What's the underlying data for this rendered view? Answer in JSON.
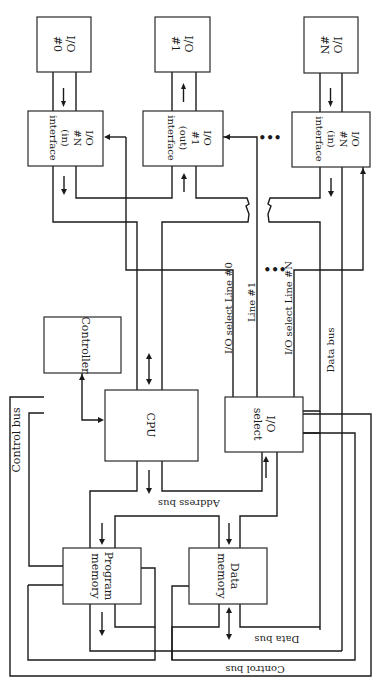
{
  "figure": {
    "orientation": "rotated-90-clockwise",
    "blocks": {
      "io0": {
        "line1": "I/O",
        "line2": "#0"
      },
      "io1": {
        "line1": "I/O",
        "line2": "#1"
      },
      "ioN": {
        "line1": "I/O",
        "line2": "#N"
      },
      "if_left": {
        "line1": "I/O",
        "line2": "#N",
        "line3": "(in)",
        "line4": "interface"
      },
      "if_mid": {
        "line1": "I/O",
        "line2": "#1",
        "line3": "(out)",
        "line4": "interface"
      },
      "if_right": {
        "line1": "I/O",
        "line2": "#N",
        "line3": "(in)",
        "line4": "interface"
      },
      "controller": {
        "label": "Controller"
      },
      "cpu": {
        "label": "CPU"
      },
      "io_select": {
        "line1": "I/O",
        "line2": "select"
      },
      "program_memory": {
        "line1": "Program",
        "line2": "memory"
      },
      "data_memory": {
        "line1": "Data",
        "line2": "memory"
      }
    },
    "bus_labels": {
      "control_bus_left": "Control bus",
      "control_bus_bottom": "Control bus",
      "address_bus": "Address bus",
      "data_bus_right": "Data bus",
      "data_bus_bottom": "Data bus",
      "io_select_line0": "I/O select  Line #0",
      "io_select_line1": "Line #1",
      "io_select_lineN": "I/O select  Line #N"
    },
    "ellipsis": "•••"
  }
}
